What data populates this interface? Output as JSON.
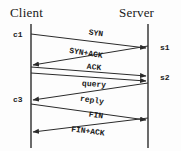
{
  "diagram": {
    "type": "sequence-diagram",
    "title_client": "Client",
    "title_server": "Server",
    "lifelines": [
      {
        "name": "client",
        "label": "Client",
        "x": 31
      },
      {
        "name": "server",
        "label": "Server",
        "x": 148
      }
    ],
    "endpoint_labels": [
      {
        "id": "c1",
        "text": "c1",
        "side": "left",
        "x": 13,
        "y": 30
      },
      {
        "id": "s1",
        "text": "s1",
        "side": "right",
        "x": 160,
        "y": 43
      },
      {
        "id": "s2",
        "text": "s2",
        "side": "right",
        "x": 160,
        "y": 73
      },
      {
        "id": "c3",
        "text": "c3",
        "side": "left",
        "x": 13,
        "y": 95
      }
    ],
    "messages": [
      {
        "index": 1,
        "label": "SYN",
        "direction": "client-to-server",
        "from_x": 31,
        "from_y": 34,
        "to_x": 146,
        "to_y": 48,
        "label_x": 96,
        "label_y": 33,
        "angle": 7
      },
      {
        "index": 2,
        "label": "SYN+ACK",
        "direction": "server-to-client",
        "from_x": 148,
        "from_y": 46,
        "to_x": 33,
        "to_y": 65,
        "label_x": 86,
        "label_y": 53,
        "angle": 9
      },
      {
        "index": 3,
        "label": "ACK",
        "direction": "client-to-server",
        "from_x": 31,
        "from_y": 67,
        "to_x": 146,
        "to_y": 76,
        "label_x": 94,
        "label_y": 67,
        "angle": 5
      },
      {
        "index": 4,
        "label": "query",
        "direction": "client-to-server",
        "from_x": 31,
        "from_y": 73,
        "to_x": 146,
        "to_y": 81,
        "label_x": 94,
        "label_y": 84,
        "angle": 4
      },
      {
        "index": 5,
        "label": "reply",
        "direction": "server-to-client",
        "from_x": 148,
        "from_y": 83,
        "to_x": 33,
        "to_y": 100,
        "label_x": 92,
        "label_y": 100,
        "angle": 8
      },
      {
        "index": 6,
        "label": "FIN",
        "direction": "client-to-server",
        "from_x": 31,
        "from_y": 104,
        "to_x": 146,
        "to_y": 120,
        "label_x": 96,
        "label_y": 115,
        "angle": 8
      },
      {
        "index": 7,
        "label": "FIN+ACK",
        "direction": "server-to-client",
        "from_x": 148,
        "from_y": 118,
        "to_x": 33,
        "to_y": 132,
        "label_x": 88,
        "label_y": 131,
        "angle": 7
      }
    ],
    "colors": {
      "line": "#2b2b2b",
      "text": "#1a1a1a",
      "background": "#fdfdfd"
    }
  }
}
